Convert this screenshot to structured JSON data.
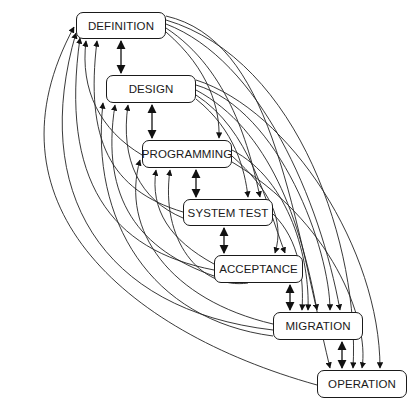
{
  "diagram": {
    "type": "phase-flow",
    "nodes": [
      {
        "id": "definition",
        "label": "DEFINITION",
        "x": 76,
        "y": 12,
        "w": 90,
        "h": 27
      },
      {
        "id": "design",
        "label": "DESIGN",
        "x": 106,
        "y": 75,
        "w": 90,
        "h": 28
      },
      {
        "id": "programming",
        "label": "PROGRAMMING",
        "x": 142,
        "y": 140,
        "w": 90,
        "h": 28
      },
      {
        "id": "system_test",
        "label": "SYSTEM TEST",
        "x": 183,
        "y": 199,
        "w": 90,
        "h": 27
      },
      {
        "id": "acceptance",
        "label": "ACCEPTANCE",
        "x": 214,
        "y": 255,
        "w": 89,
        "h": 28
      },
      {
        "id": "migration",
        "label": "MIGRATION",
        "x": 273,
        "y": 312,
        "w": 90,
        "h": 28
      },
      {
        "id": "operation",
        "label": "OPERATION",
        "x": 317,
        "y": 370,
        "w": 90,
        "h": 28
      }
    ],
    "bidirectional_links": [
      [
        "definition",
        "design"
      ],
      [
        "design",
        "programming"
      ],
      [
        "programming",
        "system_test"
      ],
      [
        "system_test",
        "acceptance"
      ],
      [
        "acceptance",
        "migration"
      ],
      [
        "migration",
        "operation"
      ]
    ],
    "feedback_edges_description": "Curved arrows from every later phase back to every earlier phase (left side) and forward from every phase to every later phase (right side)",
    "line_color": "#1a1a1a",
    "background": "#ffffff"
  }
}
